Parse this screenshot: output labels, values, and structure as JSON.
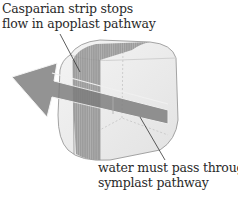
{
  "labels": {
    "casparian": {
      "line1": "Casparian strip stops",
      "line2": "flow in apoplast pathway"
    },
    "water": {
      "line1": "water must pass through",
      "line2": "symplast pathway"
    }
  },
  "colors": {
    "cell_fill": "#ececec",
    "cell_outline": "#9a9a9a",
    "strip": "#8a8a8a",
    "arrow": "#7c7c7c",
    "arrow_edge": "#f2f2f2",
    "text": "#2a2a2a",
    "leader_line": "#333333"
  }
}
